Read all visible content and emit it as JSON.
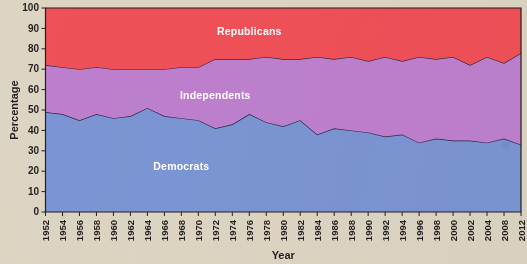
{
  "chart_data": {
    "type": "area",
    "stacked": true,
    "title": "",
    "xlabel": "Year",
    "ylabel": "Percentage",
    "ylim": [
      0,
      100
    ],
    "yticks": [
      0,
      10,
      20,
      30,
      40,
      50,
      60,
      70,
      80,
      90,
      100
    ],
    "grid": false,
    "legend_position": "inline-on-bands",
    "categories": [
      "1952",
      "1954",
      "1956",
      "1958",
      "1960",
      "1962",
      "1964",
      "1966",
      "1968",
      "1970",
      "1972",
      "1974",
      "1976",
      "1978",
      "1980",
      "1982",
      "1984",
      "1986",
      "1988",
      "1990",
      "1992",
      "1994",
      "1996",
      "1998",
      "2000",
      "2002",
      "2004",
      "2008",
      "2012"
    ],
    "x": [
      1952,
      1954,
      1956,
      1958,
      1960,
      1962,
      1964,
      1966,
      1968,
      1970,
      1972,
      1974,
      1976,
      1978,
      1980,
      1982,
      1984,
      1986,
      1988,
      1990,
      1992,
      1994,
      1996,
      1998,
      2000,
      2002,
      2004,
      2008,
      2012
    ],
    "series": [
      {
        "name": "Democrats",
        "color": "#7b95d4",
        "label": "Democrats",
        "values": [
          49,
          48,
          45,
          48,
          46,
          47,
          51,
          47,
          46,
          45,
          41,
          43,
          48,
          44,
          42,
          45,
          38,
          41,
          40,
          39,
          37,
          38,
          34,
          36,
          35,
          35,
          34,
          36,
          33
        ]
      },
      {
        "name": "Independents",
        "color": "#be80ce",
        "label": "Independents",
        "values": [
          23,
          23,
          25,
          23,
          24,
          23,
          19,
          23,
          25,
          26,
          34,
          32,
          27,
          32,
          33,
          30,
          38,
          34,
          36,
          35,
          39,
          36,
          42,
          39,
          41,
          37,
          42,
          37,
          45
        ]
      },
      {
        "name": "Republicans",
        "color": "#f05058",
        "label": "Republicans",
        "values": [
          28,
          29,
          30,
          29,
          30,
          30,
          30,
          30,
          29,
          29,
          25,
          25,
          25,
          24,
          25,
          25,
          24,
          25,
          24,
          26,
          24,
          26,
          24,
          25,
          24,
          28,
          24,
          27,
          22
        ]
      }
    ],
    "band_labels": [
      {
        "text": "Republicans",
        "x_year": 1976,
        "y_pct": 88
      },
      {
        "text": "Independents",
        "x_year": 1972,
        "y_pct": 57
      },
      {
        "text": "Democrats",
        "x_year": 1968,
        "y_pct": 22
      }
    ]
  }
}
